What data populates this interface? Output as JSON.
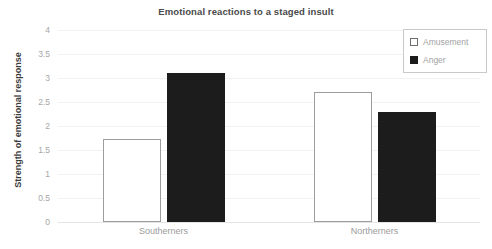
{
  "chart_data": {
    "type": "bar",
    "title": "Emotional reactions to a staged insult",
    "xlabel": "",
    "ylabel": "Strength of emotional response",
    "categories": [
      "Southerners",
      "Northerners"
    ],
    "series": [
      {
        "name": "Amusement",
        "values": [
          1.73,
          2.71
        ],
        "color": "#ffffff",
        "edge_color": "#9d9d9d"
      },
      {
        "name": "Anger",
        "values": [
          3.1,
          2.29
        ],
        "color": "#1c1c1c",
        "edge_color": "#1c1c1c"
      }
    ],
    "ylim": [
      0,
      4
    ],
    "yticks": [
      "0",
      "0.5",
      "1",
      "1.5",
      "2",
      "2.5",
      "3",
      "3.5",
      "4"
    ],
    "ytick_values": [
      0,
      0.5,
      1,
      1.5,
      2,
      2.5,
      3,
      3.5,
      4
    ],
    "grid": true,
    "legend_position": "top-right",
    "title_color": "#4a4a4a",
    "tick_color": "#a6a6a6",
    "grid_color": "#f2f2f2"
  },
  "legend": {
    "entries": [
      {
        "label": "Amusement",
        "swatch": "square-outline"
      },
      {
        "label": "Anger",
        "swatch": "square-filled"
      }
    ]
  }
}
